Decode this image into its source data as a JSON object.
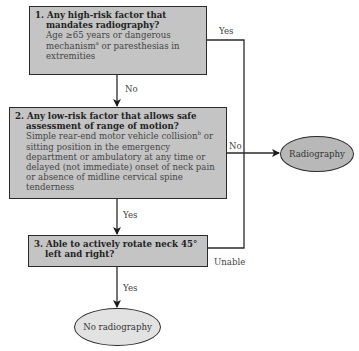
{
  "diagram": {
    "type": "flowchart",
    "colors": {
      "box_fill": "#c4c4c4",
      "radiography_fill": "#b8b8b8",
      "no_radiography_fill": "#e2e2e2",
      "line": "#2a2a2a"
    },
    "step1": {
      "question": "1. Any high-risk factor that mandates radiography?",
      "detail": "Age ≥65 years or dangerous mechanism",
      "detail_sup": "a",
      "detail_tail": " or paresthesias in extremities"
    },
    "step2": {
      "question": "2. Any low-risk factor that allows safe assessment of range of motion?",
      "detail": "Simple rear-end motor vehicle collision",
      "detail_sup": "b",
      "detail_tail": " or sitting position in the emergency department or ambulatory at any time or delayed (not immediate) onset of neck pain or absence of midline cervical spine tenderness"
    },
    "step3": {
      "question": "3. Able to actively rotate neck 45° left and right?"
    },
    "labels": {
      "step1_yes": "Yes",
      "step1_no": "No",
      "step2_no": "No",
      "step2_yes": "Yes",
      "step3_unable": "Unable",
      "step3_yes": "Yes"
    },
    "outcomes": {
      "radiography": "Radiography",
      "no_radiography": "No radiography"
    }
  }
}
